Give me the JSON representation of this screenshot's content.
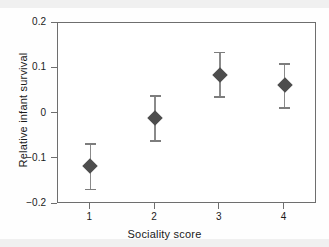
{
  "chart_data": {
    "type": "scatter",
    "title": "",
    "xlabel": "Sociality score",
    "ylabel": "Relative infant survival",
    "x": [
      1,
      2,
      3,
      4
    ],
    "categories": [
      "1",
      "2",
      "3",
      "4"
    ],
    "values": [
      -0.117,
      -0.009,
      0.086,
      0.062
    ],
    "error_low": [
      -0.17,
      -0.062,
      0.035,
      0.011
    ],
    "error_high": [
      -0.066,
      0.04,
      0.137,
      0.111
    ],
    "series": [
      {
        "name": "Relative infant survival",
        "values": [
          -0.117,
          -0.009,
          0.086,
          0.062
        ],
        "error_low": [
          -0.17,
          -0.062,
          0.035,
          0.011
        ],
        "error_high": [
          -0.066,
          0.04,
          0.137,
          0.111
        ],
        "marker": "diamond",
        "marker_color": "#4d4d4d"
      }
    ],
    "xlim": [
      0.5,
      4.5
    ],
    "ylim": [
      -0.2,
      0.2
    ],
    "xticks": [
      1,
      2,
      3,
      4
    ],
    "xticklabels": [
      "1",
      "2",
      "3",
      "4"
    ],
    "yticks": [
      0.2,
      0.1,
      0,
      -0.1,
      -0.2
    ],
    "yticklabels": [
      "0.2",
      "0.1",
      "0",
      "−0.1",
      "−0.2"
    ],
    "grid": false,
    "legend": null,
    "annotations": [],
    "colors": {
      "marker": "#4d4d4d",
      "errorbar": "#8a8a8a",
      "axis": "#6e6e6e",
      "text": "#1a1a1a",
      "background": "#ffffff"
    }
  },
  "axes": {
    "y_ticks": [
      {
        "label": "0.2",
        "value": 0.2
      },
      {
        "label": "0.1",
        "value": 0.1
      },
      {
        "label": "0",
        "value": 0.0
      },
      {
        "label": "−0.1",
        "value": -0.1
      },
      {
        "label": "−0.2",
        "value": -0.2
      }
    ],
    "x_ticks": [
      {
        "label": "1",
        "value": 1
      },
      {
        "label": "2",
        "value": 2
      },
      {
        "label": "3",
        "value": 3
      },
      {
        "label": "4",
        "value": 4
      }
    ],
    "x_title": "Sociality score",
    "y_title": "Relative infant survival"
  },
  "points": [
    {
      "name": "point-1",
      "x_label": "1",
      "value": "-0.117",
      "low": "-0.170",
      "high": "-0.066"
    },
    {
      "name": "point-2",
      "x_label": "2",
      "value": "-0.009",
      "low": "-0.062",
      "high": "0.040"
    },
    {
      "name": "point-3",
      "x_label": "3",
      "value": "0.086",
      "low": "0.035",
      "high": "0.137"
    },
    {
      "name": "point-4",
      "x_label": "4",
      "value": "0.062",
      "low": "0.011",
      "high": "0.111"
    }
  ]
}
